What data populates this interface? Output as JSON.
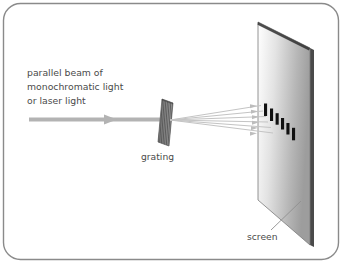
{
  "figure": {
    "background_color": "#ffffff",
    "border_color": "#8a8a8a",
    "text_color": "#4a4a4a"
  },
  "labels": {
    "beam_line1": "parallel beam of",
    "beam_line2": "monochromatic light",
    "beam_line3": "or laser light",
    "grating": "grating",
    "screen": "screen"
  },
  "diagram": {
    "incoming_beam": {
      "color": "#b0b0b0",
      "start_x": 28,
      "end_x": 160,
      "y": 119,
      "thickness": 4,
      "arrowhead_x": 112
    },
    "grating": {
      "fill": "#8f8f8f",
      "stripe_color": "#4f4f4f",
      "stripe_count": 9,
      "top_left_x": 162,
      "top_left_y": 99,
      "bottom_left_x": 158,
      "bottom_left_y": 142,
      "width": 11,
      "slant": 4
    },
    "screen": {
      "fill_start": "#ffffff",
      "fill_end": "#9a9a9a",
      "edge_color": "#3d3d3d",
      "outline_color": "#6e6e6e",
      "corners": [
        [
          258,
          22
        ],
        [
          310,
          48
        ],
        [
          310,
          245
        ],
        [
          258,
          200
        ]
      ],
      "thickness": 4
    },
    "rays": {
      "color": "#c2c2c2",
      "count": 6,
      "origin_x": 170,
      "origin_y": 120,
      "end_x": 262,
      "end_y_values": [
        106,
        112,
        118,
        124,
        130,
        136
      ],
      "arrowhead_color": "#b8b8b8"
    },
    "fringes": {
      "color": "#121212",
      "count": 6,
      "bars": [
        {
          "x": 264,
          "y": 104,
          "w": 3,
          "h": 12
        },
        {
          "x": 270,
          "y": 109,
          "w": 3,
          "h": 12
        },
        {
          "x": 276,
          "y": 113,
          "w": 3,
          "h": 11
        },
        {
          "x": 281,
          "y": 118,
          "w": 3,
          "h": 11
        },
        {
          "x": 286,
          "y": 123,
          "w": 3,
          "h": 11
        },
        {
          "x": 292,
          "y": 128,
          "w": 3,
          "h": 12
        }
      ]
    },
    "screen_leader": {
      "color": "#8a8a8a",
      "x1": 272,
      "y1": 228,
      "x2": 300,
      "y2": 202
    }
  }
}
